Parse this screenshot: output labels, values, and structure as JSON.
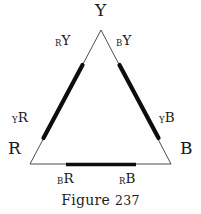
{
  "figure": {
    "caption_prefix": "Figure",
    "caption_number": "237",
    "caption_full": "Figure 237",
    "background_color": "#fefefe",
    "ink_color": "#1a1a1a"
  },
  "vertices": [
    {
      "id": "apex",
      "label": "Y",
      "x": 101,
      "y": 30
    },
    {
      "id": "bottom-left",
      "label": "R",
      "x": 30,
      "y": 164
    },
    {
      "id": "bottom-right",
      "label": "B",
      "x": 171,
      "y": 164
    }
  ],
  "vertex_labels": {
    "apex": "Y",
    "bottom_left": "R",
    "bottom_right": "B"
  },
  "edge_labels": {
    "left_upper": {
      "small": "R",
      "big": "Y",
      "text": "RY"
    },
    "right_upper": {
      "small": "B",
      "big": "Y",
      "text": "BY"
    },
    "left_lower": {
      "small": "Y",
      "big": "R",
      "text": "YR"
    },
    "right_lower": {
      "small": "Y",
      "big": "B",
      "text": "YB"
    },
    "base_left": {
      "small": "B",
      "big": "R",
      "text": "BR"
    },
    "base_right": {
      "small": "R",
      "big": "B",
      "text": "RB"
    }
  },
  "edges": [
    {
      "id": "left-edge",
      "from": "R",
      "to": "Y",
      "thick_band": true
    },
    {
      "id": "right-edge",
      "from": "Y",
      "to": "B",
      "thick_band": true
    },
    {
      "id": "base-edge",
      "from": "R",
      "to": "B",
      "thick_band": true
    }
  ]
}
